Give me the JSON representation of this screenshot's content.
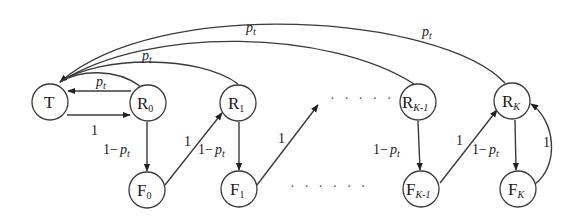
{
  "diagram": {
    "type": "state-transition-graph",
    "colors": {
      "stroke": "#3a3a3a",
      "text": "#1a1a1a",
      "background": "#ffffff"
    },
    "nodes": [
      {
        "id": "T",
        "label": "T",
        "sub": "",
        "cx": 50,
        "cy": 102
      },
      {
        "id": "R0",
        "label": "R",
        "sub": "0",
        "cx": 148,
        "cy": 103
      },
      {
        "id": "R1",
        "label": "R",
        "sub": "1",
        "cx": 238,
        "cy": 103
      },
      {
        "id": "RK-1",
        "label": "R",
        "sub": "K-1",
        "cx": 418,
        "cy": 102
      },
      {
        "id": "RK",
        "label": "R",
        "sub": "K",
        "cx": 512,
        "cy": 101
      },
      {
        "id": "F0",
        "label": "F",
        "sub": "0",
        "cx": 147,
        "cy": 190
      },
      {
        "id": "F1",
        "label": "F",
        "sub": "1",
        "cx": 239,
        "cy": 189
      },
      {
        "id": "FK-1",
        "label": "F",
        "sub": "K-1",
        "cx": 421,
        "cy": 189
      },
      {
        "id": "FK",
        "label": "F",
        "sub": "K",
        "cx": 518,
        "cy": 189
      }
    ],
    "edges": [
      {
        "from": "T",
        "to": "R0",
        "label": "1"
      },
      {
        "from": "R0",
        "to": "T",
        "label": "p_t",
        "display": "pt"
      },
      {
        "from": "R0",
        "to": "T",
        "label": "p_t",
        "kind": "arc",
        "display": ""
      },
      {
        "from": "R1",
        "to": "T",
        "label": "p_t",
        "kind": "arc",
        "display": "pt"
      },
      {
        "from": "RK-1",
        "to": "T",
        "label": "p_t",
        "kind": "arc",
        "display": "pt"
      },
      {
        "from": "RK",
        "to": "T",
        "label": "p_t",
        "kind": "arc",
        "display": "pt"
      },
      {
        "from": "R0",
        "to": "F0",
        "label": "1 - p_t"
      },
      {
        "from": "R1",
        "to": "F1",
        "label": "1 - p_t"
      },
      {
        "from": "RK-1",
        "to": "FK-1",
        "label": "1 - p_t"
      },
      {
        "from": "RK",
        "to": "FK",
        "label": "1 - p_t"
      },
      {
        "from": "F0",
        "to": "R1",
        "label": "1"
      },
      {
        "from": "F1",
        "to": "...",
        "label": "1"
      },
      {
        "from": "FK-1",
        "to": "RK",
        "label": "1"
      },
      {
        "from": "FK",
        "to": "RK",
        "label": "1"
      }
    ],
    "labels": {
      "one": "1",
      "p": "p",
      "t": "t",
      "one_minus": "1−",
      "ellipsis": "· · · · · ·"
    }
  }
}
